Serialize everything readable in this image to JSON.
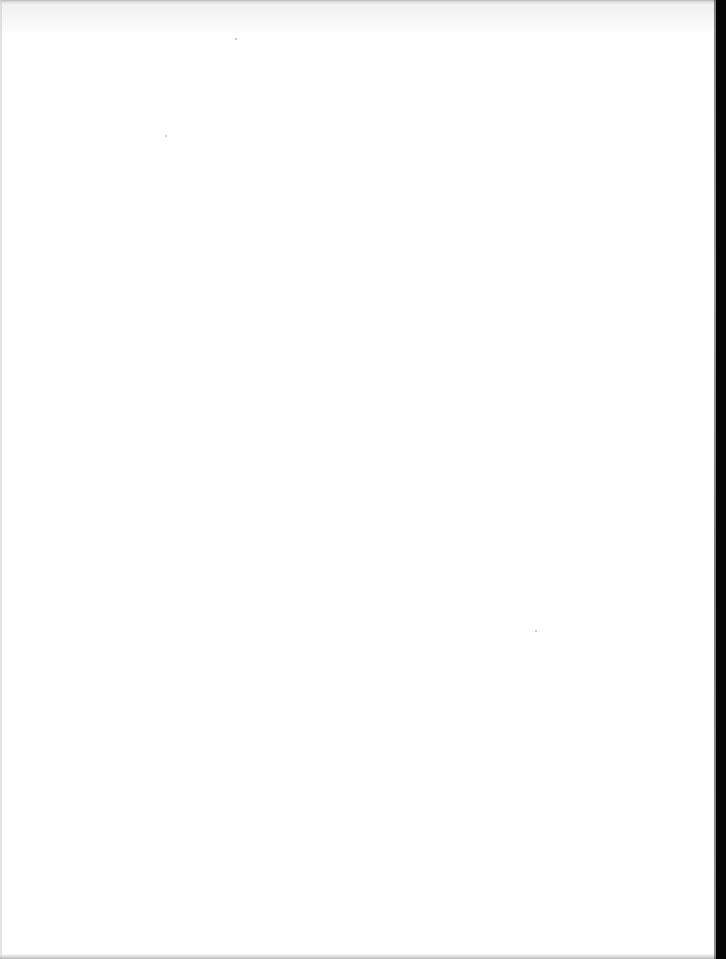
{
  "document": {
    "type": "scanned-page",
    "content": "",
    "colors": {
      "paper": "#ffffff",
      "scan_border": "#050505",
      "edge_shadow": "#9a9a9a"
    }
  }
}
